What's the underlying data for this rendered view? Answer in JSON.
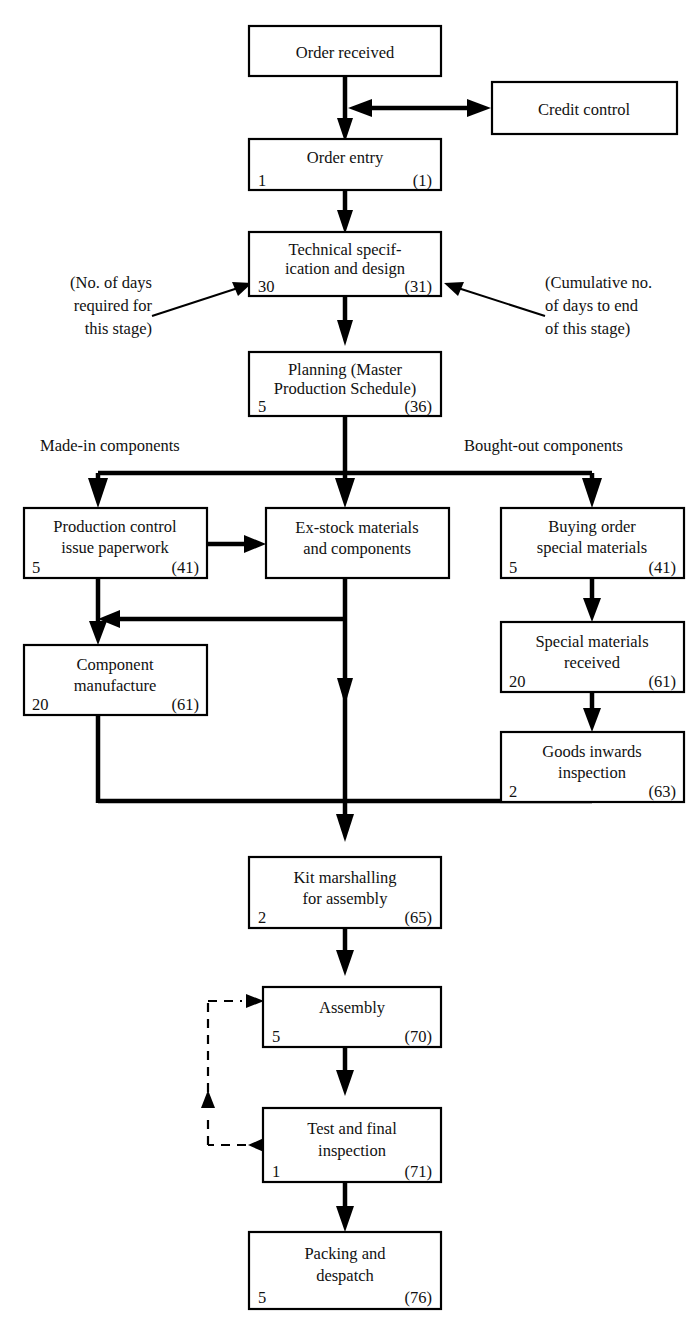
{
  "diagram": {
    "legend_notes": {
      "left_note_line1": "(No. of days",
      "left_note_line2": "required for",
      "left_note_line3": "this stage)",
      "right_note_line1": "(Cumulative no.",
      "right_note_line2": "of days to end",
      "right_note_line3": "of this stage)"
    },
    "branch_labels": {
      "left": "Made-in components",
      "right": "Bought-out components"
    },
    "nodes": [
      {
        "id": "order-received",
        "line1": "Order received",
        "line2": "",
        "days": "",
        "cumulative": ""
      },
      {
        "id": "credit-control",
        "line1": "Credit control",
        "line2": "",
        "days": "",
        "cumulative": ""
      },
      {
        "id": "order-entry",
        "line1": "Order entry",
        "line2": "",
        "days": "1",
        "cumulative": "(1)"
      },
      {
        "id": "technical-specification-and-design",
        "line1": "Technical specif-",
        "line2": "ication and design",
        "days": "30",
        "cumulative": "(31)"
      },
      {
        "id": "planning-master-production-schedule",
        "line1": "Planning (Master",
        "line2": "Production Schedule)",
        "days": "5",
        "cumulative": "(36)"
      },
      {
        "id": "production-control-issue-paperwork",
        "line1": "Production control",
        "line2": "issue paperwork",
        "days": "5",
        "cumulative": "(41)"
      },
      {
        "id": "ex-stock-materials-and-components",
        "line1": "Ex-stock materials",
        "line2": "and components",
        "days": "",
        "cumulative": ""
      },
      {
        "id": "buying-order-special-materials",
        "line1": "Buying order",
        "line2": "special materials",
        "days": "5",
        "cumulative": "(41)"
      },
      {
        "id": "component-manufacture",
        "line1": "Component",
        "line2": "manufacture",
        "days": "20",
        "cumulative": "(61)"
      },
      {
        "id": "special-materials-received",
        "line1": "Special materials",
        "line2": "received",
        "days": "20",
        "cumulative": "(61)"
      },
      {
        "id": "goods-inwards-inspection",
        "line1": "Goods inwards",
        "line2": "inspection",
        "days": "2",
        "cumulative": "(63)"
      },
      {
        "id": "kit-marshalling-for-assembly",
        "line1": "Kit marshalling",
        "line2": "for assembly",
        "days": "2",
        "cumulative": "(65)"
      },
      {
        "id": "assembly",
        "line1": "Assembly",
        "line2": "",
        "days": "5",
        "cumulative": "(70)"
      },
      {
        "id": "test-and-final-inspection",
        "line1": "Test and final",
        "line2": "inspection",
        "days": "1",
        "cumulative": "(71)"
      },
      {
        "id": "packing-and-despatch",
        "line1": "Packing and",
        "line2": "despatch",
        "days": "5",
        "cumulative": "(76)"
      }
    ],
    "colors": {
      "line": "#000000",
      "box_fill": "#ffffff",
      "text": "#111111"
    }
  }
}
